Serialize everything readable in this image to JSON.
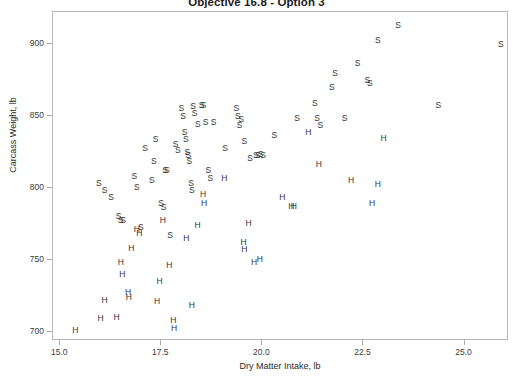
{
  "chart_data": {
    "type": "scatter",
    "title": "Objective 16.8 - Option 3",
    "xlabel": "Dry Matter Intake, lb",
    "ylabel": "Carcass Weight, lb",
    "xlim": [
      14.82,
      26.1
    ],
    "ylim": [
      694,
      922
    ],
    "xticks": [
      15.0,
      17.5,
      20.0,
      22.5,
      25.0
    ],
    "xtick_labels": [
      "15.0",
      "17.5",
      "20.0",
      "22.5",
      "25.0"
    ],
    "yticks": [
      700,
      750,
      800,
      850,
      900
    ],
    "ytick_labels": [
      "700",
      "750",
      "800",
      "850",
      "900"
    ],
    "grid": false,
    "legend": "none",
    "marker_style": "letter-glyph",
    "series": [
      {
        "name": "S",
        "marker": "S",
        "color": "#333333",
        "points": [
          [
            15.98,
            803
          ],
          [
            16.12,
            798
          ],
          [
            16.28,
            793
          ],
          [
            16.47,
            780
          ],
          [
            16.52,
            777
          ],
          [
            16.58,
            777
          ],
          [
            16.86,
            808
          ],
          [
            16.92,
            800
          ],
          [
            17.02,
            772
          ],
          [
            17.12,
            827
          ],
          [
            17.29,
            805
          ],
          [
            17.34,
            818
          ],
          [
            17.38,
            833
          ],
          [
            17.52,
            789
          ],
          [
            17.58,
            786
          ],
          [
            17.62,
            812
          ],
          [
            17.66,
            812
          ],
          [
            17.74,
            767
          ],
          [
            17.88,
            830
          ],
          [
            17.93,
            826
          ],
          [
            18.02,
            855
          ],
          [
            18.06,
            849
          ],
          [
            18.1,
            838
          ],
          [
            18.13,
            833
          ],
          [
            18.17,
            824
          ],
          [
            18.19,
            822
          ],
          [
            18.22,
            818
          ],
          [
            18.26,
            803
          ],
          [
            18.28,
            798
          ],
          [
            18.31,
            856
          ],
          [
            18.35,
            851
          ],
          [
            18.43,
            844
          ],
          [
            18.52,
            857
          ],
          [
            18.57,
            857
          ],
          [
            18.62,
            845
          ],
          [
            18.69,
            812
          ],
          [
            18.74,
            806
          ],
          [
            18.82,
            845
          ],
          [
            19.1,
            827
          ],
          [
            19.38,
            855
          ],
          [
            19.42,
            849
          ],
          [
            19.46,
            843
          ],
          [
            19.5,
            847
          ],
          [
            19.58,
            832
          ],
          [
            19.72,
            820
          ],
          [
            19.86,
            822
          ],
          [
            19.92,
            822
          ],
          [
            19.98,
            823
          ],
          [
            20.04,
            822
          ],
          [
            20.32,
            836
          ],
          [
            20.88,
            848
          ],
          [
            21.32,
            858
          ],
          [
            21.38,
            848
          ],
          [
            21.46,
            843
          ],
          [
            21.74,
            869
          ],
          [
            21.82,
            879
          ],
          [
            22.06,
            848
          ],
          [
            22.38,
            886
          ],
          [
            22.62,
            874
          ],
          [
            22.68,
            872
          ],
          [
            22.88,
            902
          ],
          [
            23.38,
            912
          ],
          [
            24.38,
            857
          ],
          [
            25.92,
            899
          ]
        ]
      },
      {
        "name": "H",
        "marker": "H",
        "color": "#333333",
        "points": [
          [
            15.4,
            701
          ],
          [
            16.02,
            709
          ],
          [
            16.12,
            722
          ],
          [
            16.42,
            710
          ],
          [
            16.52,
            748
          ],
          [
            16.56,
            740
          ],
          [
            16.7,
            727
          ],
          [
            16.72,
            724
          ],
          [
            16.78,
            758
          ],
          [
            16.92,
            771
          ],
          [
            16.98,
            768
          ],
          [
            17.42,
            721
          ],
          [
            17.48,
            735
          ],
          [
            17.56,
            777
          ],
          [
            17.72,
            746
          ],
          [
            17.82,
            708
          ],
          [
            17.84,
            702
          ],
          [
            18.14,
            765
          ],
          [
            18.28,
            718
          ],
          [
            18.42,
            774
          ],
          [
            18.56,
            795
          ],
          [
            18.58,
            789
          ],
          [
            19.08,
            806
          ],
          [
            19.56,
            762
          ],
          [
            19.58,
            757
          ],
          [
            19.68,
            775
          ],
          [
            19.82,
            748
          ],
          [
            19.96,
            750
          ],
          [
            20.52,
            793
          ],
          [
            20.74,
            787
          ],
          [
            20.8,
            787
          ],
          [
            21.16,
            838
          ],
          [
            21.42,
            816
          ],
          [
            22.22,
            805
          ],
          [
            22.74,
            789
          ],
          [
            22.88,
            802
          ],
          [
            23.02,
            834
          ]
        ]
      }
    ]
  }
}
